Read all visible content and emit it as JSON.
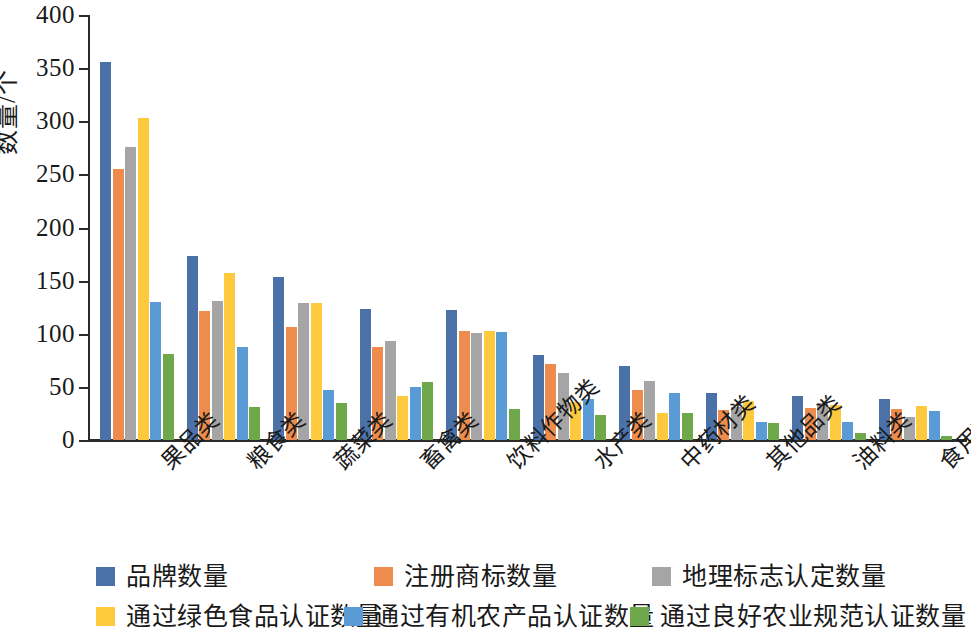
{
  "chart_data": {
    "type": "bar",
    "title": "",
    "xlabel": "",
    "ylabel": "数量/个",
    "ylim": [
      0,
      400
    ],
    "yticks": [
      0,
      50,
      100,
      150,
      200,
      250,
      300,
      350,
      400
    ],
    "grid": false,
    "legend_position": "bottom",
    "categories": [
      "果品类",
      "粮食类",
      "蔬菜类",
      "畜禽类",
      "饮料作物类",
      "水产类",
      "中药材类",
      "其他品类",
      "油料类",
      "食用菌类"
    ],
    "series": [
      {
        "name": "品牌数量",
        "color": "#4A72A8",
        "values": [
          356,
          173,
          153,
          123,
          122,
          80,
          70,
          44,
          41,
          39
        ]
      },
      {
        "name": "注册商标数量",
        "color": "#ED8C4C",
        "values": [
          255,
          121,
          106,
          88,
          103,
          72,
          47,
          28,
          30,
          29
        ]
      },
      {
        "name": "地理标志认定数量",
        "color": "#A5A5A5",
        "values": [
          276,
          131,
          129,
          93,
          101,
          63,
          56,
          31,
          35,
          22
        ]
      },
      {
        "name": "通过绿色食品认证数量",
        "color": "#FFC93E",
        "values": [
          303,
          157,
          129,
          41,
          103,
          36,
          25,
          37,
          33,
          32
        ]
      },
      {
        "name": "通过有机农产品认证数量",
        "color": "#5B9BD5",
        "values": [
          130,
          88,
          47,
          50,
          102,
          39,
          44,
          17,
          17,
          27
        ]
      },
      {
        "name": "通过良好农业规范认证数量",
        "color": "#6FA84A",
        "values": [
          81,
          31,
          35,
          55,
          29,
          24,
          25,
          16,
          7,
          4
        ]
      }
    ]
  }
}
